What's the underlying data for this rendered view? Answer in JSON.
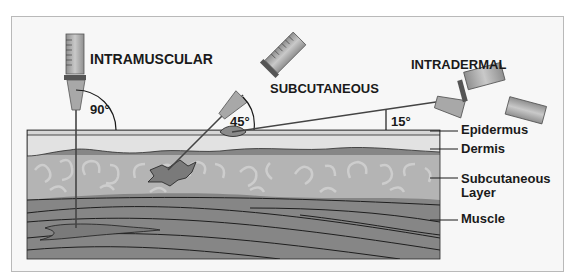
{
  "diagram": {
    "type": "injection-angles",
    "injections": [
      {
        "name": "INTRAMUSCULAR",
        "angle": "90°"
      },
      {
        "name": "SUBCUTANEOUS",
        "angle": "45°"
      },
      {
        "name": "INTRADERMAL",
        "angle": "15°"
      }
    ],
    "layers": [
      {
        "name": "Epidermus"
      },
      {
        "name": "Dermis"
      },
      {
        "name": "Subcutaneous Layer",
        "line1": "Subcutaneous",
        "line2": "Layer"
      },
      {
        "name": "Muscle"
      }
    ],
    "colors": {
      "background": "#f7f7f7",
      "epidermis": "#d6d6d6",
      "dermis": "#e2e2e2",
      "subcutaneous": "#b4b4b4",
      "subcutaneous_pattern": "#d0d0d0",
      "muscle": "#868686",
      "outline": "#2a2a2a"
    }
  }
}
